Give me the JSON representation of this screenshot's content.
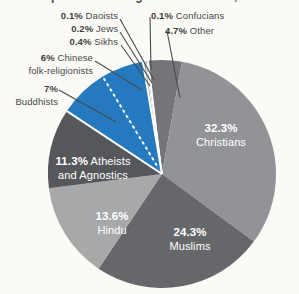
{
  "title": {
    "text_partial": "Proportion of Religions Worldwide, 2020",
    "visibility": "clipped at top edge"
  },
  "chart_data": {
    "type": "pie",
    "title": "Proportion of Religions Worldwide, 2020",
    "unit": "percent",
    "start_angle_deg": -7.2,
    "clockwise_order": [
      "Confucians",
      "Other",
      "Christians",
      "Muslims",
      "Hindu",
      "Atheists and Agnostics",
      "Buddhists",
      "Chinese folk-religionists",
      "Sikhs",
      "Jews",
      "Daoists"
    ],
    "legend_position": "labels around and inside pie",
    "accent_color": "#2579be",
    "separator_color": "#ffffff",
    "dashed_divider_between": [
      "Buddhists",
      "Chinese folk-religionists"
    ],
    "slices": [
      {
        "name": "Daoists",
        "value": 0.1,
        "pct": "0.1%",
        "name1": "Daoists",
        "name2": "",
        "color": "#5a5b5e",
        "placement": "outside-left"
      },
      {
        "name": "Jews",
        "value": 0.2,
        "pct": "0.2%",
        "name1": "Jews",
        "name2": "",
        "color": "#77787b",
        "placement": "outside-left"
      },
      {
        "name": "Sikhs",
        "value": 0.4,
        "pct": "0.4%",
        "name1": "Sikhs",
        "name2": "",
        "color": "#989a9c",
        "placement": "outside-left"
      },
      {
        "name": "Chinese folk-religionists",
        "value": 6,
        "pct": "6%",
        "name1": "Chinese",
        "name2": "folk-religionists",
        "color": "#2579be",
        "placement": "outside-left"
      },
      {
        "name": "Buddhists",
        "value": 7,
        "pct": "7%",
        "name1": "",
        "name2": "Buddhists",
        "color": "#2579be",
        "placement": "outside-left"
      },
      {
        "name": "Confucians",
        "value": 0.1,
        "pct": "0.1%",
        "name1": "Confucians",
        "name2": "",
        "color": "#8d8e91",
        "placement": "outside-right"
      },
      {
        "name": "Other",
        "value": 4.7,
        "pct": "4.7%",
        "name1": "Other",
        "name2": "",
        "color": "#747578",
        "placement": "outside-right"
      },
      {
        "name": "Christians",
        "value": 32.3,
        "pct": "32.3%",
        "name1": "",
        "name2": "Christians",
        "color": "#929396",
        "placement": "inside"
      },
      {
        "name": "Muslims",
        "value": 24.3,
        "pct": "24.3%",
        "name1": "",
        "name2": "Muslims",
        "color": "#66676a",
        "placement": "inside"
      },
      {
        "name": "Hindu",
        "value": 13.6,
        "pct": "13.6%",
        "name1": "",
        "name2": "Hindu",
        "color": "#a7a8aa",
        "placement": "inside"
      },
      {
        "name": "Atheists and Agnostics",
        "value": 11.3,
        "pct": "11.3%",
        "name1": "Atheists",
        "name2": "and Agnostics",
        "color": "#56575b",
        "placement": "inside"
      }
    ]
  }
}
